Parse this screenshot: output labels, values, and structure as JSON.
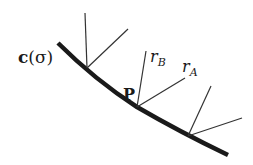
{
  "diagram": {
    "curve_label": "c(σ)",
    "curve_label_parts": {
      "bold": "c",
      "rest": "(σ)"
    },
    "point_label": "P",
    "ray_b": {
      "main": "r",
      "sub": "B"
    },
    "ray_a": {
      "main": "r",
      "sub": "A"
    },
    "colors": {
      "ink": "#1a1a1a",
      "background": "#ffffff"
    }
  }
}
